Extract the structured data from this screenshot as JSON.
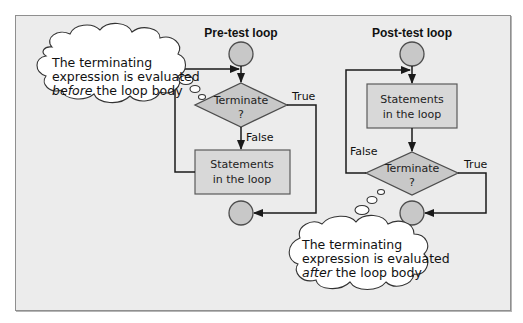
{
  "colors": {
    "panel_bg": "#ececec",
    "panel_border": "#8f8f8f",
    "node_fill": "#c8c8c8",
    "box_fill": "#d8d8d8",
    "line": "#1a1a1a",
    "cloud_fill": "#ffffff"
  },
  "pre_test": {
    "title": "Pre-test loop",
    "decision": {
      "line1": "Terminate",
      "line2": "?"
    },
    "statements": {
      "line1": "Statements",
      "line2": "in the loop"
    },
    "true_label": "True",
    "false_label": "False"
  },
  "post_test": {
    "title": "Post-test loop",
    "decision": {
      "line1": "Terminate",
      "line2": "?"
    },
    "statements": {
      "line1": "Statements",
      "line2": "in the loop"
    },
    "true_label": "True",
    "false_label": "False"
  },
  "callouts": {
    "pre": {
      "line1": "The terminating",
      "line2": "expression is evaluated",
      "line3_emph": "before",
      "line3_rest": " the loop body"
    },
    "post": {
      "line1": "The terminating",
      "line2": "expression is evaluated",
      "line3_emph": "after",
      "line3_rest": " the loop body"
    }
  }
}
